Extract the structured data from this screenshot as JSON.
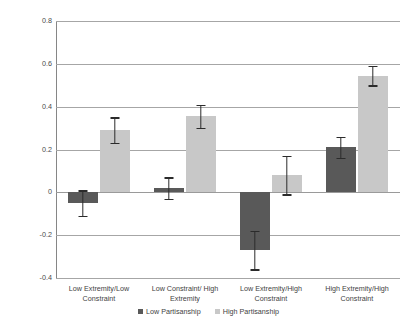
{
  "chart_data": {
    "type": "bar",
    "title": "",
    "xlabel": "",
    "ylabel": "",
    "ylim": [
      -0.4,
      0.8
    ],
    "ytick_labels": [
      "0.8",
      "0.6",
      "0.4",
      "0.2",
      "0",
      "-0.2",
      "-0.4"
    ],
    "ytick_values": [
      0.8,
      0.6,
      0.4,
      0.2,
      0,
      -0.2,
      -0.4
    ],
    "grid": true,
    "legend_position": "bottom",
    "categories": [
      "Low Extremity/Low Constraint",
      "Low Constraint/ High Extremity",
      "Low Extremity/High Constraint",
      "High Extremity/High Constraint"
    ],
    "series": [
      {
        "name": "Low Partisanship",
        "color": "#595959",
        "values": [
          -0.05,
          0.02,
          -0.27,
          0.21
        ],
        "errors": [
          0.06,
          0.05,
          0.09,
          0.05
        ]
      },
      {
        "name": "High Partisanship",
        "color": "#c8c8c8",
        "values": [
          0.29,
          0.355,
          0.08,
          0.545
        ],
        "errors": [
          0.06,
          0.055,
          0.09,
          0.045
        ]
      }
    ]
  },
  "legend": {
    "items": [
      {
        "label": "Low Partisanship"
      },
      {
        "label": "High Partisanship"
      }
    ]
  },
  "axis": {
    "ticks": [
      {
        "label": "0.8"
      },
      {
        "label": "0.6"
      },
      {
        "label": "0.4"
      },
      {
        "label": "0.2"
      },
      {
        "label": "0"
      },
      {
        "label": "-0.2"
      },
      {
        "label": "-0.4"
      }
    ]
  }
}
